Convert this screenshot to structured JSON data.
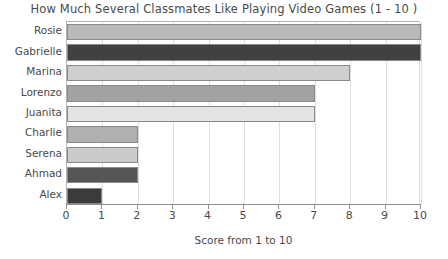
{
  "chart_data": {
    "type": "bar",
    "orientation": "horizontal",
    "title": "How Much Several Classmates Like Playing Video Games (1 - 10 )",
    "xlabel": "Score from 1 to 10",
    "ylabel": "",
    "categories": [
      "Rosie",
      "Gabrielle",
      "Marina",
      "Lorenzo",
      "Juanita",
      "Charlie",
      "Serena",
      "Ahmad",
      "Alex"
    ],
    "values": [
      10,
      10,
      8,
      7,
      7,
      2,
      2,
      2,
      1
    ],
    "bar_colors": [
      "#b9b9b9",
      "#414141",
      "#cfcfcf",
      "#a3a3a3",
      "#e4e4e4",
      "#b0b0b0",
      "#cbcbcb",
      "#555555",
      "#3b3b3b"
    ],
    "xlim": [
      0,
      10
    ],
    "xticks": [
      0,
      1,
      2,
      3,
      4,
      5,
      6,
      7,
      8,
      9,
      10
    ],
    "xtick_labels": [
      "0",
      "1",
      "2",
      "3",
      "4",
      "5",
      "6",
      "7",
      "8",
      "9",
      "10"
    ],
    "grid": true,
    "grid_axis": "x",
    "legend": false,
    "bar_edge_color": "#8a8a8a",
    "axis_color": "#8f8f8f",
    "gridline_color": "#dedede",
    "background": "#ffffff"
  }
}
